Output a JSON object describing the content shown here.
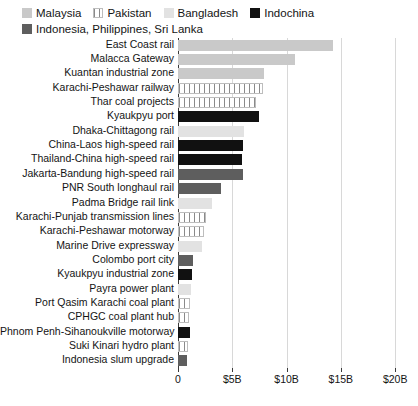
{
  "chart_data": {
    "type": "bar",
    "orientation": "horizontal",
    "title": "",
    "xlabel": "",
    "ylabel": "",
    "xlim": [
      0,
      21
    ],
    "grid": true,
    "legend_position": "top-left",
    "xtick_labels": [
      "0",
      "$5B",
      "$10B",
      "$15B",
      "$20B"
    ],
    "xtick_values": [
      0,
      5,
      10,
      15,
      20
    ],
    "legend": [
      {
        "label": "Malaysia",
        "fill": "f-malaysia",
        "color": "#c9c9c9"
      },
      {
        "label": "Pakistan",
        "fill": "f-pakistan",
        "color": "#ffffff"
      },
      {
        "label": "Bangladesh",
        "fill": "f-bangladesh",
        "color": "#e2e2e2"
      },
      {
        "label": "Indochina",
        "fill": "f-indochina",
        "color": "#111111"
      },
      {
        "label": "Indonesia, Philippines, Sri Lanka",
        "fill": "f-ipsl",
        "color": "#5e5e5e"
      }
    ],
    "categories": [
      "East Coast rail",
      "Malacca Gateway",
      "Kuantan industrial zone",
      "Karachi-Peshawar railway",
      "Thar coal projects",
      "Kyaukpyu port",
      "Dhaka-Chittagong rail",
      "China-Laos high-speed rail",
      "Thailand-China high-speed rail",
      "Jakarta-Bandung high-speed rail",
      "PNR South longhaul rail",
      "Padma Bridge rail link",
      "Karachi-Punjab transmission lines",
      "Karachi-Peshawar motorway",
      "Marine Drive expressway",
      "Colombo port city",
      "Kyaukpyu industrial zone",
      "Payra power plant",
      "Port Qasim Karachi coal plant",
      "CPHGC coal plant hub",
      "Phnom Penh-Sihanoukville motorway",
      "Suki Kinari hydro plant",
      "Indonesia slum upgrade"
    ],
    "values": [
      14.3,
      10.8,
      7.9,
      7.8,
      7.2,
      7.5,
      6.1,
      6.0,
      5.9,
      6.0,
      4.0,
      3.1,
      2.6,
      2.4,
      2.2,
      1.4,
      1.3,
      1.2,
      1.1,
      1.0,
      1.1,
      0.9,
      0.8
    ],
    "series_of": [
      "Malaysia",
      "Malaysia",
      "Malaysia",
      "Pakistan",
      "Pakistan",
      "Indochina",
      "Bangladesh",
      "Indochina",
      "Indochina",
      "Indonesia, Philippines, Sri Lanka",
      "Indonesia, Philippines, Sri Lanka",
      "Bangladesh",
      "Pakistan",
      "Pakistan",
      "Bangladesh",
      "Indonesia, Philippines, Sri Lanka",
      "Indochina",
      "Bangladesh",
      "Pakistan",
      "Pakistan",
      "Indochina",
      "Pakistan",
      "Indonesia, Philippines, Sri Lanka"
    ],
    "fills": [
      "f-malaysia",
      "f-malaysia",
      "f-malaysia",
      "f-pakistan",
      "f-pakistan",
      "f-indochina",
      "f-bangladesh",
      "f-indochina",
      "f-indochina",
      "f-ipsl",
      "f-ipsl",
      "f-bangladesh",
      "f-pakistan",
      "f-pakistan",
      "f-bangladesh",
      "f-ipsl",
      "f-indochina",
      "f-bangladesh",
      "f-pakistan",
      "f-pakistan",
      "f-indochina",
      "f-pakistan",
      "f-ipsl"
    ]
  }
}
